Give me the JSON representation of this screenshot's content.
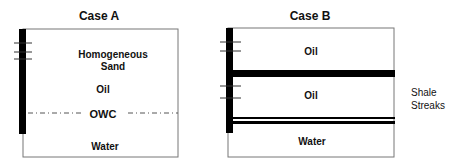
{
  "case_a": {
    "title": "Case A",
    "labels": {
      "sand_line1": "Homogeneous",
      "sand_line2": "Sand",
      "oil": "Oil",
      "owc": "OWC",
      "water": "Water"
    }
  },
  "case_b": {
    "title": "Case B",
    "labels": {
      "oil_upper": "Oil",
      "oil_lower": "Oil",
      "water": "Water",
      "shale_line1": "Shale",
      "shale_line2": "Streaks"
    }
  },
  "colors": {
    "line": "#777777",
    "well": "#000000",
    "text": "#111111"
  }
}
